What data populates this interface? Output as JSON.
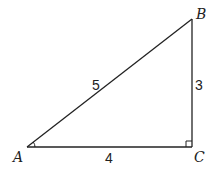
{
  "diagram": {
    "type": "right-triangle",
    "vertices": {
      "A": {
        "label": "A",
        "x": 27,
        "y": 147
      },
      "B": {
        "label": "B",
        "x": 192,
        "y": 19
      },
      "C": {
        "label": "C",
        "x": 192,
        "y": 147
      }
    },
    "sides": {
      "hypotenuse_AB": {
        "label": "5"
      },
      "vertical_BC": {
        "label": "3"
      },
      "base_AC": {
        "label": "4"
      }
    },
    "markers": {
      "right_angle_at": "C",
      "angle_arc_at": "A"
    },
    "colors": {
      "stroke": "#222222",
      "background": "#ffffff"
    }
  }
}
